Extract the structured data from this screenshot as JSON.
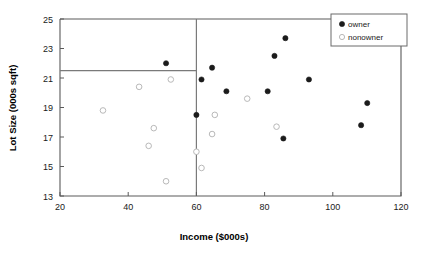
{
  "chart_data": {
    "type": "scatter",
    "title": "",
    "xlabel": "Income ($000s)",
    "ylabel": "Lot Size (000s sqft)",
    "xlim": [
      20,
      120
    ],
    "ylim": [
      13,
      25
    ],
    "xticks": [
      20,
      40,
      60,
      80,
      100,
      120
    ],
    "yticks": [
      13,
      15,
      17,
      19,
      21,
      23,
      25
    ],
    "grid": false,
    "legend_position": "top-right",
    "legend": [
      "owner",
      "nonowner"
    ],
    "annotations": {
      "vertical_split_x": 60,
      "horizontal_split_y": 21.5
    },
    "series": [
      {
        "name": "owner",
        "marker": "filled-circle",
        "color": "#1b1b1b",
        "points": [
          {
            "x": 51.1,
            "y": 22.0
          },
          {
            "x": 60.0,
            "y": 18.5
          },
          {
            "x": 61.5,
            "y": 20.9
          },
          {
            "x": 64.6,
            "y": 21.7
          },
          {
            "x": 68.8,
            "y": 20.1
          },
          {
            "x": 80.9,
            "y": 20.1
          },
          {
            "x": 82.9,
            "y": 22.5
          },
          {
            "x": 86.1,
            "y": 23.7
          },
          {
            "x": 85.5,
            "y": 16.9
          },
          {
            "x": 93.0,
            "y": 20.9
          },
          {
            "x": 108.3,
            "y": 17.8
          },
          {
            "x": 110.1,
            "y": 19.3
          }
        ]
      },
      {
        "name": "nonowner",
        "marker": "open-circle",
        "color": "#b9b9b9",
        "points": [
          {
            "x": 32.6,
            "y": 18.8
          },
          {
            "x": 43.2,
            "y": 20.4
          },
          {
            "x": 52.5,
            "y": 20.9
          },
          {
            "x": 47.5,
            "y": 17.6
          },
          {
            "x": 46.0,
            "y": 16.4
          },
          {
            "x": 51.1,
            "y": 14.0
          },
          {
            "x": 60.0,
            "y": 16.0
          },
          {
            "x": 61.5,
            "y": 14.9
          },
          {
            "x": 65.4,
            "y": 18.5
          },
          {
            "x": 64.6,
            "y": 17.2
          },
          {
            "x": 74.9,
            "y": 19.6
          },
          {
            "x": 83.5,
            "y": 17.7
          }
        ]
      }
    ]
  }
}
